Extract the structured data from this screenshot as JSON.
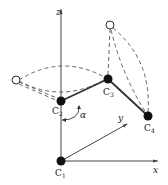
{
  "diagram": {
    "type": "3d-coordinate-joint-diagram",
    "axes": {
      "x_label": "x",
      "y_label": "y",
      "z_label": "z"
    },
    "angle_label": "α",
    "nodes": [
      {
        "id": "C1",
        "label": "C",
        "sub": "1",
        "filled": true
      },
      {
        "id": "C2",
        "label": "C",
        "sub": "2",
        "filled": true
      },
      {
        "id": "C3",
        "label": "C",
        "sub": "3",
        "filled": true
      },
      {
        "id": "C4",
        "label": "C",
        "sub": "4",
        "filled": true
      },
      {
        "id": "open-left",
        "filled": false
      },
      {
        "id": "open-top",
        "filled": false
      }
    ],
    "bonds": [
      {
        "from": "C2",
        "to": "C3",
        "style": "solid"
      },
      {
        "from": "C3",
        "to": "C4",
        "style": "solid"
      }
    ],
    "colors": {
      "line": "#333333",
      "dashed": "#555555",
      "node_fill": "#111111",
      "open_fill": "#ffffff"
    }
  }
}
